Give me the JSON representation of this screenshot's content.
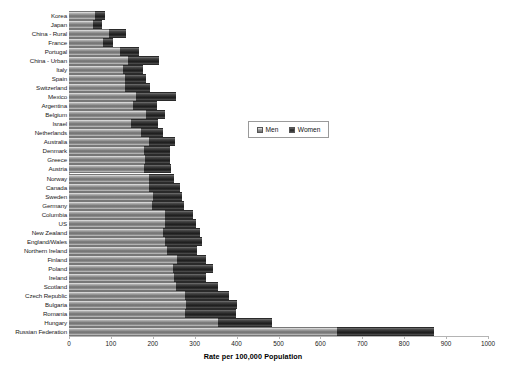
{
  "chart_data": {
    "type": "bar",
    "orientation": "horizontal",
    "stacked": true,
    "title": "",
    "xlabel": "Rate per 100,000 Population",
    "ylabel": "",
    "xlim": [
      0,
      1000
    ],
    "xticks": [
      0,
      100,
      200,
      300,
      400,
      500,
      600,
      700,
      800,
      900,
      1000
    ],
    "grid": false,
    "legend_position": "inset-right-middle",
    "categories": [
      "Korea",
      "Japan",
      "China - Rural",
      "France",
      "Portugal",
      "China - Urban",
      "Italy",
      "Spain",
      "Switzerland",
      "Mexico",
      "Argentina",
      "Belgium",
      "Israel",
      "Netherlands",
      "Australia",
      "Denmark",
      "Greece",
      "Austria",
      "Norway",
      "Canada",
      "Sweden",
      "Germany",
      "Columbia",
      "US",
      "New Zealand",
      "England/Wales",
      "Northern Ireland",
      "Finland",
      "Poland",
      "Ireland",
      "Scotland",
      "Czech Republic",
      "Bulgaria",
      "Romania",
      "Hungary",
      "Russian Federation"
    ],
    "series": [
      {
        "name": "Men",
        "color": "#8e8e8e",
        "values": [
          63,
          58,
          95,
          82,
          122,
          140,
          128,
          133,
          133,
          160,
          153,
          183,
          148,
          172,
          190,
          180,
          182,
          178,
          190,
          190,
          200,
          197,
          228,
          228,
          225,
          228,
          235,
          258,
          248,
          250,
          255,
          278,
          280,
          278,
          355,
          640
        ]
      },
      {
        "name": "Women",
        "color": "#262626",
        "values": [
          22,
          20,
          40,
          22,
          45,
          75,
          48,
          50,
          60,
          95,
          58,
          45,
          65,
          52,
          62,
          60,
          60,
          65,
          60,
          75,
          70,
          78,
          68,
          75,
          88,
          90,
          70,
          68,
          95,
          78,
          100,
          105,
          120,
          120,
          130,
          230
        ]
      }
    ]
  },
  "legend": {
    "items": [
      {
        "label": "Men"
      },
      {
        "label": "Women"
      }
    ]
  }
}
